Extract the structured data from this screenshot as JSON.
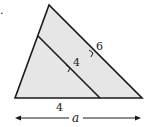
{
  "diagram": {
    "marker": ".",
    "colors": {
      "fill": "#e6e6e6",
      "stroke": "#1a1a1a"
    },
    "labels": {
      "outer_side": "6",
      "inner_side": "4",
      "base_segment": "4",
      "dimension": "a"
    }
  }
}
